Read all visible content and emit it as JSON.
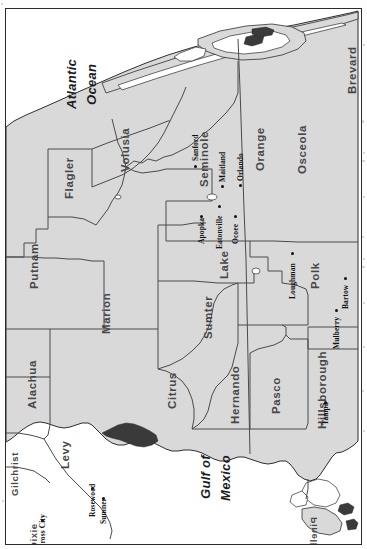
{
  "document": {
    "kind": "scanned-map",
    "region": "Central and North Florida",
    "orientation_note": "map printed rotated 90 degrees clockwise; north is toward the left edge",
    "frame": "thin black rectangular border"
  },
  "palette": {
    "land_fill": "#d9d9d9",
    "water_fill": "#ffffff",
    "county_line": "#4a4a4a",
    "coast_line": "#2e2e2e",
    "frame_line": "#2b2b2b",
    "county_label": "#474747",
    "city_label": "#111111",
    "page_background": "#fdfdfd"
  },
  "water_labels": [
    {
      "name": "Atlantic Ocean",
      "line1": "Atlantic",
      "line2": "Ocean"
    },
    {
      "name": "Gulf of Mexico",
      "line1": "Gulf of",
      "line2": "Mexico"
    }
  ],
  "counties": [
    {
      "id": "brevard",
      "label": "Brevard"
    },
    {
      "id": "osceola",
      "label": "Osceola"
    },
    {
      "id": "orange",
      "label": "Orange"
    },
    {
      "id": "seminole",
      "label": "Seminole"
    },
    {
      "id": "volusia",
      "label": "Volusia"
    },
    {
      "id": "flagler",
      "label": "Flagler"
    },
    {
      "id": "putnam",
      "label": "Putnam"
    },
    {
      "id": "alachua",
      "label": "Alachua"
    },
    {
      "id": "gilchrist",
      "label": "Gilchrist"
    },
    {
      "id": "dixie",
      "label": "Dixie"
    },
    {
      "id": "levy",
      "label": "Levy"
    },
    {
      "id": "marion",
      "label": "Marion"
    },
    {
      "id": "citrus",
      "label": "Citrus"
    },
    {
      "id": "sumter",
      "label": "Sumter"
    },
    {
      "id": "lake",
      "label": "Lake"
    },
    {
      "id": "polk",
      "label": "Polk"
    },
    {
      "id": "hernando",
      "label": "Hernando"
    },
    {
      "id": "pasco",
      "label": "Pasco"
    },
    {
      "id": "hillsborough",
      "label": "Hillsborough"
    },
    {
      "id": "pinellas",
      "label": "Pinellas"
    }
  ],
  "cities": [
    {
      "id": "sanford",
      "label": "Sanford",
      "county": "seminole"
    },
    {
      "id": "maitland",
      "label": "Maitland",
      "county": "orange"
    },
    {
      "id": "orlando",
      "label": "Orlando",
      "county": "orange"
    },
    {
      "id": "apopka",
      "label": "Apopka",
      "county": "orange"
    },
    {
      "id": "eatonville",
      "label": "Eatonville",
      "county": "orange"
    },
    {
      "id": "ocoee",
      "label": "Ocoee",
      "county": "orange"
    },
    {
      "id": "loughman",
      "label": "Loughman",
      "county": "polk"
    },
    {
      "id": "bartow",
      "label": "Bartow",
      "county": "polk"
    },
    {
      "id": "mulberry",
      "label": "Mulberry",
      "county": "polk"
    },
    {
      "id": "tampa",
      "label": "Tampa",
      "county": "hillsborough"
    },
    {
      "id": "crosscity",
      "label": "Cross City",
      "county": "dixie"
    },
    {
      "id": "rosewood",
      "label": "Rosewood",
      "county": "levy"
    },
    {
      "id": "sumner",
      "label": "Sumner",
      "county": "levy"
    }
  ]
}
